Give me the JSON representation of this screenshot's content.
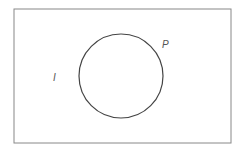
{
  "diagram": {
    "type": "venn",
    "universe": {
      "label": "I",
      "x": 14,
      "y": 9,
      "width": 217,
      "height": 134,
      "stroke": "#888888"
    },
    "set": {
      "label": "P",
      "cx": 121,
      "cy": 76,
      "r": 42,
      "stroke": "#444444"
    }
  }
}
